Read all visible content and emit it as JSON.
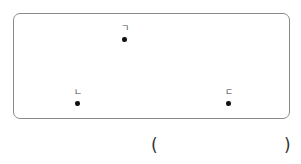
{
  "diagram": {
    "points": [
      {
        "label": "ㄱ",
        "x": 124,
        "y": 39
      },
      {
        "label": "ㄴ",
        "x": 77,
        "y": 103
      },
      {
        "label": "ㄷ",
        "x": 228,
        "y": 103
      }
    ]
  },
  "answer": {
    "open_paren": "(",
    "close_paren": ")",
    "value": ""
  }
}
